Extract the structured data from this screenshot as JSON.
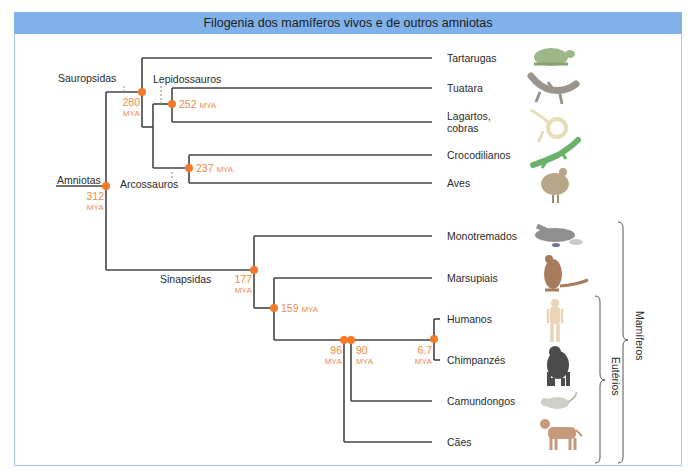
{
  "title": "Filogenia dos mamíferos vivos e de outros amniotas",
  "colors": {
    "title_bar": "#80b1ea",
    "frame_border": "#a9c8ec",
    "branch": "#444444",
    "node": "#f47a2a",
    "date_text": "#ef8a4a"
  },
  "clades": {
    "amniotas": "Amniotas",
    "sauropsidas": "Sauropsidas",
    "lepidossauros": "Lepidossauros",
    "arcossauros": "Arcossauros",
    "sinapsidas": "Sinapsidas"
  },
  "nodes": {
    "n312": {
      "value": "312",
      "unit": "MYA"
    },
    "n280": {
      "value": "280",
      "unit": "MYA"
    },
    "n252": {
      "value": "252",
      "unit": "MYA"
    },
    "n237": {
      "value": "237",
      "unit": "MYA"
    },
    "n177": {
      "value": "177",
      "unit": "MYA"
    },
    "n159": {
      "value": "159",
      "unit": "MYA"
    },
    "n96": {
      "value": "96",
      "unit": "MYA"
    },
    "n90": {
      "value": "90",
      "unit": "MYA"
    },
    "n6_7": {
      "value": "6.7",
      "unit": "MYA"
    }
  },
  "taxa": [
    {
      "label": "Tartarugas",
      "icon": "turtle-icon"
    },
    {
      "label": "Tuatara",
      "icon": "tuatara-icon"
    },
    {
      "label_line1": "Lagartos,",
      "label_line2": "cobras",
      "icon": "snake-icon"
    },
    {
      "label": "Crocodilianos",
      "icon": "crocodile-icon"
    },
    {
      "label": "Aves",
      "icon": "bird-icon"
    },
    {
      "label": "Monotremados",
      "icon": "platypus-icon"
    },
    {
      "label": "Marsupiais",
      "icon": "kangaroo-icon"
    },
    {
      "label": "Humanos",
      "icon": "human-icon"
    },
    {
      "label": "Chimpanzés",
      "icon": "chimpanzee-icon"
    },
    {
      "label": "Camundongos",
      "icon": "mouse-icon"
    },
    {
      "label": "Cães",
      "icon": "dog-icon"
    }
  ],
  "groups": {
    "mamiferos": "Mamíferos",
    "euterios": "Eutérios"
  }
}
